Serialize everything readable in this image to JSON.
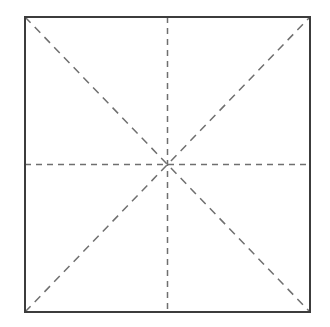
{
  "figure": {
    "name": "square-crease-pattern",
    "background_color": "#ffffff",
    "canvas": {
      "width": 330,
      "height": 327
    }
  },
  "geometry": {
    "square": {
      "left": 25,
      "top": 17,
      "right": 310,
      "bottom": 312,
      "width": 285,
      "height": 295
    },
    "center": {
      "x": 167.5,
      "y": 164.5
    }
  },
  "styles": {
    "outline_color": "#3c3c3c",
    "outline_width": 1.4,
    "dash_color": "#6f6f6f",
    "dash_width": 1.5,
    "dash_pattern_orthogonal": "6 5",
    "dash_pattern_diagonal": "8 6"
  },
  "elements": {
    "square_outline_label": "square outline",
    "horizontal_fold_label": "horizontal center fold",
    "vertical_fold_label": "vertical center fold",
    "diagonal_tl_br_label": "diagonal fold top-left to bottom-right",
    "diagonal_bl_tr_label": "diagonal fold bottom-left to top-right",
    "center_point_label": "center intersection point"
  },
  "chart_data": {
    "type": "line",
    "title": "",
    "xlabel": "",
    "ylabel": "",
    "xlim": [
      0,
      330
    ],
    "ylim": [
      0,
      327
    ],
    "grid": false,
    "legend": null,
    "series": [
      {
        "name": "square outline",
        "style": "solid",
        "color": "#3c3c3c",
        "x": [
          25,
          310,
          310,
          25,
          25
        ],
        "y": [
          17,
          17,
          312,
          312,
          17
        ]
      },
      {
        "name": "horizontal center fold",
        "style": "dashed",
        "color": "#6f6f6f",
        "x": [
          25,
          310
        ],
        "y": [
          164.5,
          164.5
        ]
      },
      {
        "name": "vertical center fold",
        "style": "dashed",
        "color": "#6f6f6f",
        "x": [
          167.5,
          167.5
        ],
        "y": [
          17,
          312
        ]
      },
      {
        "name": "diagonal fold top-left to bottom-right",
        "style": "dashed",
        "color": "#6f6f6f",
        "x": [
          25,
          310
        ],
        "y": [
          17,
          312
        ]
      },
      {
        "name": "diagonal fold bottom-left to top-right",
        "style": "dashed",
        "color": "#6f6f6f",
        "x": [
          25,
          310
        ],
        "y": [
          312,
          17
        ]
      }
    ],
    "annotations": []
  }
}
